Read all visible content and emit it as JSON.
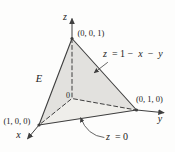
{
  "colors": {
    "background": "#fdfdfc",
    "plane_face": "#e2e1de",
    "base_face": "#efeeea",
    "line": "#3f3f3f",
    "text": "#222222"
  },
  "labels": {
    "z_axis": "z",
    "y_axis": "y",
    "x_axis": "x",
    "origin": "0",
    "region": "E",
    "vertex_top": "(0, 0, 1)",
    "vertex_right": "(0, 1, 0)",
    "vertex_left": "(1, 0, 0)",
    "plane_equation": {
      "z": "z",
      "eq1": " = 1 − ",
      "x": "x",
      "minus": " − ",
      "y": "y"
    },
    "base_equation": {
      "z": "z",
      "eq": " = 0"
    }
  }
}
